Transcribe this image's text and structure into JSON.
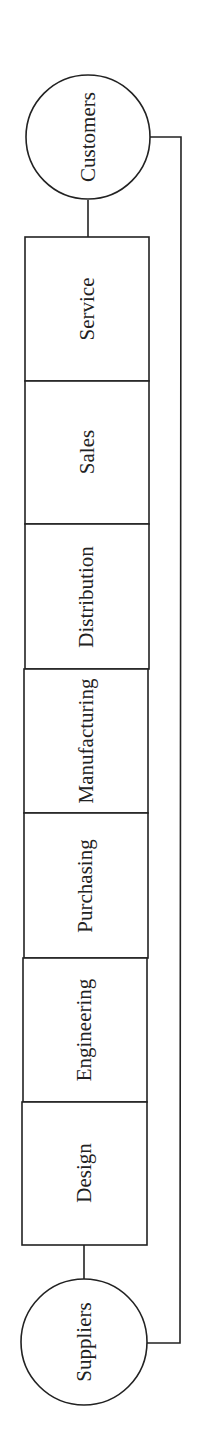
{
  "diagram": {
    "type": "value-chain",
    "orientation": "rotated-90-ccw",
    "colors": {
      "line": "#222222",
      "background": "#ffffff"
    },
    "start_node": {
      "label": "Suppliers",
      "shape": "circle"
    },
    "end_node": {
      "label": "Customers",
      "shape": "circle"
    },
    "stages": [
      {
        "label": "Design"
      },
      {
        "label": "Engineering"
      },
      {
        "label": "Purchasing"
      },
      {
        "label": "Manufacturing"
      },
      {
        "label": "Distribution"
      },
      {
        "label": "Sales"
      },
      {
        "label": "Service"
      }
    ],
    "feedback_link": {
      "from": "Suppliers",
      "to": "Customers"
    }
  }
}
